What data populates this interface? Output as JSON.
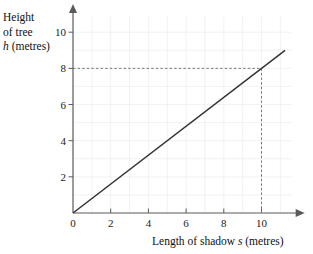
{
  "chart_data": {
    "type": "line",
    "title": "",
    "xlabel": "Length of shadow s (metres)",
    "ylabel": "Height of tree h (metres)",
    "xlabel_parts": {
      "pre": "Length of shadow ",
      "variable": "s",
      "post": " (metres)"
    },
    "ylabel_lines": [
      "Height",
      "of tree"
    ],
    "ylabel_variable": "h",
    "ylabel_last_post": " (metres)",
    "xlim": [
      0,
      11.6
    ],
    "ylim": [
      0,
      10.9
    ],
    "xticks": [
      0,
      2,
      4,
      6,
      8,
      10
    ],
    "yticks": [
      0,
      2,
      4,
      6,
      8,
      10
    ],
    "xticklabels": [
      "0",
      "2",
      "4",
      "6",
      "8",
      "10"
    ],
    "yticklabels": [
      "",
      "2",
      "4",
      "6",
      "8",
      "10"
    ],
    "origin_label": "0",
    "grid": true,
    "grid_step": 1,
    "grid_color": "#e9ecef",
    "legend": null,
    "axis_color": "#5a5a5a",
    "line_color": "#333333",
    "guide_color": "#777777",
    "series": [
      {
        "name": "height vs shadow",
        "relation": "h = 0.8 s",
        "slope": 0.8,
        "intercept": 0,
        "x": [
          0,
          11.25
        ],
        "values": [
          0,
          9.0
        ]
      }
    ],
    "annotations": [
      {
        "name": "guide-to-10",
        "style": "dashed",
        "point_x": 10,
        "point_y": 8,
        "from_axis": "both",
        "label_x": "10",
        "label_y": "8"
      }
    ]
  }
}
